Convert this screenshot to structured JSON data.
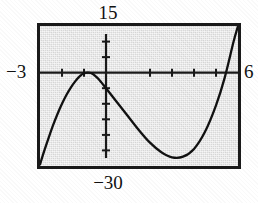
{
  "figure": {
    "kind": "graphing-calculator-screen",
    "caption_labels": {
      "ymax": "15",
      "ymin": "−30",
      "xmin": "−3",
      "xmax": "6"
    }
  },
  "chart_data": {
    "type": "line",
    "title": "",
    "xlabel": "",
    "ylabel": "",
    "xlim": [
      -3,
      6
    ],
    "ylim": [
      -30,
      15
    ],
    "grid": false,
    "legend": null,
    "axis_style": "ticks-on-axes",
    "x_tick_step": 1,
    "y_tick_step": 5,
    "x_ticks": [
      -3,
      -2,
      -1,
      0,
      1,
      2,
      3,
      4,
      5,
      6
    ],
    "y_ticks": [
      -30,
      -25,
      -20,
      -15,
      -10,
      -5,
      0,
      5,
      10,
      15
    ],
    "series": [
      {
        "name": "cubic",
        "curve_description": "cubic rising from lower-left, local maximum on the x-axis near x=-1, decreasing through a y-intercept near y=-5, local minimum near (3,-27), then rising steeply and crossing the x-axis near x=4.6",
        "x": [
          -3.0,
          -2.8,
          -2.6,
          -2.4,
          -2.2,
          -2.0,
          -1.8,
          -1.6,
          -1.4,
          -1.2,
          -1.0,
          -0.8,
          -0.6,
          -0.4,
          -0.2,
          0.0,
          0.5,
          1.0,
          1.5,
          2.0,
          2.5,
          3.0,
          3.5,
          4.0,
          4.5,
          5.0,
          5.4,
          5.8,
          6.0
        ],
        "y": [
          -29.5,
          -25.0,
          -20.8,
          -16.8,
          -13.2,
          -10.0,
          -7.2,
          -4.8,
          -2.8,
          -1.2,
          -0.2,
          0.0,
          -0.4,
          -1.6,
          -3.2,
          -5.0,
          -9.5,
          -14.0,
          -18.5,
          -22.5,
          -25.5,
          -27.2,
          -27.0,
          -24.5,
          -19.0,
          -10.5,
          -1.5,
          10.0,
          15.0
        ]
      }
    ]
  }
}
